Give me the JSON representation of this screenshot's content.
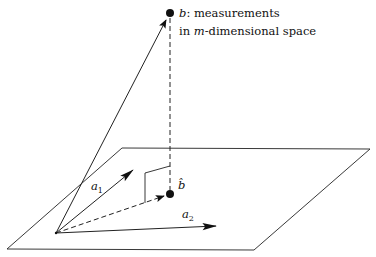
{
  "diagram": {
    "type": "least-squares projection geometry",
    "colors": {
      "stroke": "#111111",
      "background": "#ffffff"
    },
    "plane": {
      "corners": [
        [
          122,
          148
        ],
        [
          370,
          149
        ],
        [
          254,
          250
        ],
        [
          7,
          249
        ]
      ]
    },
    "origin": [
      56,
      233
    ],
    "points": {
      "b": {
        "pos": [
          170,
          13
        ],
        "label_var": "b",
        "label_desc_line1": ": measurements",
        "label_desc_line2_pre": "in ",
        "label_desc_line2_var": "m",
        "label_desc_line2_post": "-dimensional space"
      },
      "b_hat": {
        "pos": [
          170,
          194
        ],
        "label_var": "b̂"
      }
    },
    "vectors": {
      "a1": {
        "tip": [
          133,
          170
        ],
        "label_var": "a",
        "label_sub": "1"
      },
      "a2": {
        "tip": [
          216,
          226
        ],
        "label_var": "a",
        "label_sub": "2"
      }
    },
    "right_angle_marker": [
      [
        145,
        203
      ],
      [
        145,
        173
      ],
      [
        170,
        166
      ]
    ]
  }
}
